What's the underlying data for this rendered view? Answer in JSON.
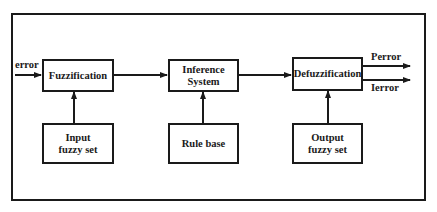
{
  "diagram": {
    "blocks": {
      "fuzzification": {
        "label": "Fuzzification"
      },
      "inference": {
        "line1": "Inference",
        "line2": "System"
      },
      "defuzzification": {
        "label": "Defuzzification"
      },
      "input_set": {
        "line1": "Input",
        "line2": "fuzzy set"
      },
      "rule_base": {
        "label": "Rule base"
      },
      "output_set": {
        "line1": "Output",
        "line2": "fuzzy set"
      }
    },
    "signals": {
      "input": "error",
      "output_p": "Perror",
      "output_i": "Ierror"
    },
    "colors": {
      "stroke": "#1a1a1a",
      "background": "#ffffff"
    }
  }
}
